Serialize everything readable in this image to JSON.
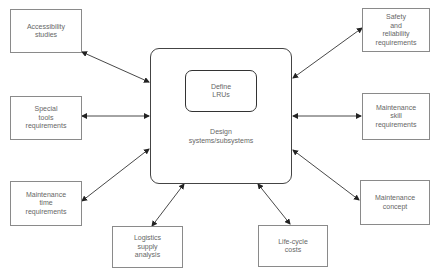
{
  "diagram": {
    "center": {
      "inner_label": "Define\nLRUs",
      "label": "Design\nsystems/subsystems"
    },
    "nodes": [
      {
        "id": "accessibility",
        "label": "Accessibility\nstudies",
        "side": "left"
      },
      {
        "id": "special-tools",
        "label": "Special\ntools\nrequirements",
        "side": "left"
      },
      {
        "id": "maintenance-time",
        "label": "Maintenance\ntime\nrequirements",
        "side": "left"
      },
      {
        "id": "logistics",
        "label": "Logistics\nsupply\nanalysis",
        "side": "bottom"
      },
      {
        "id": "life-cycle",
        "label": "Life-cycle\ncosts",
        "side": "bottom"
      },
      {
        "id": "safety",
        "label": "Safety\nand\nreliability\nrequirements",
        "side": "right"
      },
      {
        "id": "maintenance-skill",
        "label": "Maintenance\nskill\nrequirements",
        "side": "right"
      },
      {
        "id": "maintenance-concept",
        "label": "Maintenance\nconcept",
        "side": "right"
      }
    ],
    "edges": [
      {
        "from": "accessibility",
        "to": "center",
        "arrows": "both"
      },
      {
        "from": "special-tools",
        "to": "center",
        "arrows": "both"
      },
      {
        "from": "maintenance-time",
        "to": "center",
        "arrows": "both"
      },
      {
        "from": "logistics",
        "to": "center",
        "arrows": "both"
      },
      {
        "from": "life-cycle",
        "to": "center",
        "arrows": "both"
      },
      {
        "from": "safety",
        "to": "center",
        "arrows": "both"
      },
      {
        "from": "maintenance-skill",
        "to": "center",
        "arrows": "both"
      },
      {
        "from": "maintenance-concept",
        "to": "center",
        "arrows": "both"
      }
    ]
  }
}
